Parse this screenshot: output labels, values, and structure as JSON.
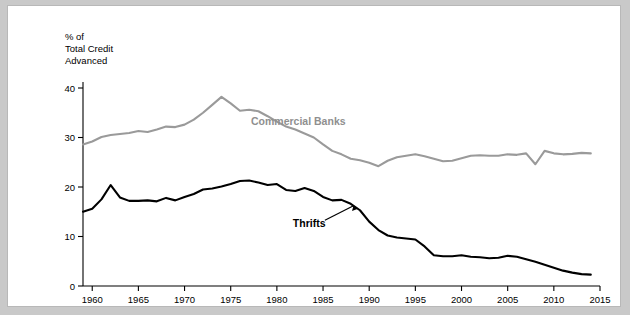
{
  "chart_data": {
    "type": "line",
    "title": "",
    "ylabel": "% of\nTotal Credit\nAdvanced",
    "ylabel_lines": [
      "% of",
      "Total Credit",
      "Advanced"
    ],
    "xlabel": "",
    "xlim": [
      1959,
      2015
    ],
    "ylim": [
      0,
      40
    ],
    "yticks": [
      0,
      10,
      20,
      30,
      40
    ],
    "xticks": [
      1960,
      1965,
      1970,
      1975,
      1980,
      1985,
      1990,
      1995,
      2000,
      2005,
      2010,
      2015
    ],
    "grid": false,
    "legend_position": "inline-annotations",
    "annotations": [
      {
        "name": "commercial-banks-label",
        "text": "Commercial Banks",
        "x": 1977.2,
        "y": 32.6,
        "color": "#8f8f8f"
      },
      {
        "name": "thrifts-label",
        "text": "Thrifts",
        "x": 1983.5,
        "y": 12.0,
        "color": "#000000"
      }
    ],
    "series": [
      {
        "name": "Commercial Banks",
        "color": "#9a9a9a",
        "x": [
          1959,
          1960,
          1961,
          1962,
          1963,
          1964,
          1965,
          1966,
          1967,
          1968,
          1969,
          1970,
          1971,
          1972,
          1973,
          1974,
          1975,
          1976,
          1977,
          1978,
          1979,
          1980,
          1981,
          1982,
          1983,
          1984,
          1985,
          1986,
          1987,
          1988,
          1989,
          1990,
          1991,
          1992,
          1993,
          1994,
          1995,
          1996,
          1997,
          1998,
          1999,
          2000,
          2001,
          2002,
          2003,
          2004,
          2005,
          2006,
          2007,
          2008,
          2009,
          2010,
          2011,
          2012,
          2013,
          2014
        ],
        "values": [
          28.6,
          29.2,
          30.1,
          30.5,
          30.7,
          30.9,
          31.3,
          31.1,
          31.6,
          32.2,
          32.1,
          32.6,
          33.6,
          35.0,
          36.6,
          38.2,
          36.9,
          35.4,
          35.6,
          35.3,
          34.3,
          33.2,
          32.2,
          31.6,
          30.8,
          30.0,
          28.6,
          27.3,
          26.6,
          25.7,
          25.4,
          24.9,
          24.2,
          25.3,
          26.0,
          26.3,
          26.6,
          26.2,
          25.7,
          25.2,
          25.3,
          25.8,
          26.3,
          26.4,
          26.3,
          26.3,
          26.6,
          26.5,
          26.8,
          24.6,
          27.3,
          26.8,
          26.6,
          26.7,
          26.9,
          26.8
        ]
      },
      {
        "name": "Thrifts",
        "color": "#000000",
        "x": [
          1959,
          1960,
          1961,
          1962,
          1963,
          1964,
          1965,
          1966,
          1967,
          1968,
          1969,
          1970,
          1971,
          1972,
          1973,
          1974,
          1975,
          1976,
          1977,
          1978,
          1979,
          1980,
          1981,
          1982,
          1983,
          1984,
          1985,
          1986,
          1987,
          1988,
          1989,
          1990,
          1991,
          1992,
          1993,
          1994,
          1995,
          1996,
          1997,
          1998,
          1999,
          2000,
          2001,
          2002,
          2003,
          2004,
          2005,
          2006,
          2007,
          2008,
          2009,
          2010,
          2011,
          2012,
          2013,
          2014
        ],
        "values": [
          15.0,
          15.6,
          17.5,
          20.4,
          17.9,
          17.2,
          17.2,
          17.3,
          17.1,
          17.8,
          17.3,
          18.0,
          18.6,
          19.5,
          19.7,
          20.1,
          20.6,
          21.2,
          21.3,
          20.9,
          20.4,
          20.6,
          19.4,
          19.2,
          19.8,
          19.2,
          18.0,
          17.3,
          17.4,
          16.6,
          15.3,
          13.0,
          11.3,
          10.2,
          9.8,
          9.6,
          9.4,
          8.0,
          6.2,
          6.0,
          6.0,
          6.2,
          5.9,
          5.8,
          5.6,
          5.7,
          6.1,
          5.9,
          5.4,
          4.9,
          4.3,
          3.7,
          3.1,
          2.7,
          2.4,
          2.3
        ]
      }
    ]
  }
}
